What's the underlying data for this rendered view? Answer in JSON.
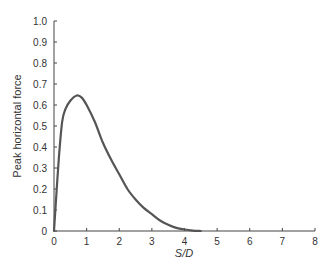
{
  "chart_data": {
    "type": "line",
    "title": "",
    "xlabel": "S/D",
    "ylabel": "Peak horizontal force",
    "xlim": [
      0,
      8
    ],
    "ylim": [
      0,
      1.0
    ],
    "xticks": [
      "0",
      "1",
      "2",
      "3",
      "4",
      "5",
      "6",
      "7",
      "8"
    ],
    "yticks": [
      "0",
      "0.1",
      "0.2",
      "0.3",
      "0.4",
      "0.5",
      "0.6",
      "0.7",
      "0.8",
      "0.9",
      "1.0"
    ],
    "grid": false,
    "legend": null,
    "series": [
      {
        "name": "Peak horizontal force",
        "color": "#555555",
        "x": [
          0,
          0.05,
          0.15,
          0.25,
          0.35,
          0.5,
          0.7,
          0.85,
          1.0,
          1.25,
          1.5,
          1.75,
          2.0,
          2.25,
          2.5,
          2.75,
          3.0,
          3.25,
          3.5,
          3.75,
          4.0,
          4.25,
          4.5,
          5,
          6,
          7,
          8
        ],
        "y": [
          0,
          0.12,
          0.35,
          0.52,
          0.58,
          0.62,
          0.645,
          0.635,
          0.6,
          0.52,
          0.42,
          0.34,
          0.27,
          0.2,
          0.15,
          0.11,
          0.08,
          0.05,
          0.03,
          0.015,
          0.007,
          0.002,
          0,
          0,
          0,
          0,
          0
        ]
      }
    ]
  }
}
